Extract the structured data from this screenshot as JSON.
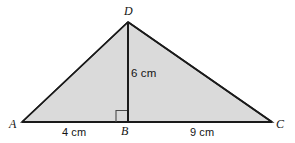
{
  "figure": {
    "kind": "geometry-diagram",
    "shape": "triangle",
    "fill_color": "#dadada",
    "stroke_color": "#1a1a1a",
    "background_color": "#ffffff",
    "vertices": [
      {
        "name": "D",
        "label": "D",
        "x": 128,
        "y": 22
      },
      {
        "name": "A",
        "label": "A",
        "x": 22,
        "y": 122
      },
      {
        "name": "C",
        "label": "C",
        "x": 272,
        "y": 122
      },
      {
        "name": "B",
        "label": "B",
        "x": 128,
        "y": 122
      }
    ],
    "altitude": {
      "from": "D",
      "foot": "B",
      "label": "6 cm",
      "right_angle_marker": true
    },
    "segments": [
      {
        "name": "AB",
        "label": "4 cm"
      },
      {
        "name": "BC",
        "label": "9 cm"
      }
    ],
    "labels": {
      "vertex_d": "D",
      "vertex_a": "A",
      "vertex_b": "B",
      "vertex_c": "C",
      "height": "6 cm",
      "base_left": "4 cm",
      "base_right": "9 cm"
    }
  }
}
